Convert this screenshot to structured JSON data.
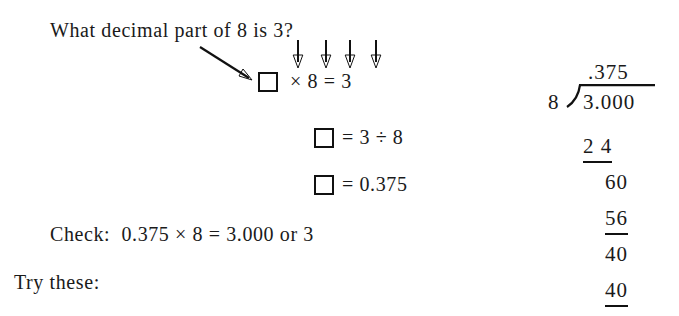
{
  "page": {
    "background_color": "#ffffff",
    "ink_color": "#111111"
  },
  "lesson": {
    "prompt": "What decimal part of 8 is 3?",
    "equations": [
      {
        "box": "□",
        "text": "× 8 = 3"
      },
      {
        "box": "□",
        "text": "= 3 ÷ 8"
      },
      {
        "box": "□",
        "text": "= 0.375"
      }
    ],
    "check_line": "Check:  0.375 × 8 = 3.000 or 3",
    "try_these": "Try these:"
  },
  "annotations": {
    "pointer_arrow_name": "diagonal-pointer-arrow",
    "mapping_arrow_count": 4,
    "mapping_arrow_labels": [
      "8",
      "8",
      "3",
      "3"
    ]
  },
  "long_division": {
    "quotient": ".375",
    "divisor": "8",
    "bracket": ")",
    "dividend": "3.000",
    "steps": [
      {
        "value": "2 4",
        "ruled": true
      },
      {
        "value": "60",
        "ruled": false
      },
      {
        "value": "56",
        "ruled": true
      },
      {
        "value": "40",
        "ruled": false
      },
      {
        "value": "40",
        "ruled": true
      }
    ]
  }
}
